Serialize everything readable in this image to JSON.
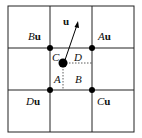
{
  "diagram": {
    "title": "",
    "grid": {
      "cols": 3,
      "rows": 3
    },
    "vector_label": "u",
    "corner_labels": [
      {
        "id": "B",
        "text_italic": "B",
        "text_bold": "u",
        "x": 28,
        "y": 30
      },
      {
        "id": "A",
        "text_italic": "A",
        "text_bold": "u",
        "x": 98,
        "y": 30
      },
      {
        "id": "D",
        "text_italic": "D",
        "text_bold": "u",
        "x": 26,
        "y": 96
      },
      {
        "id": "C",
        "text_italic": "C",
        "text_bold": "u",
        "x": 97,
        "y": 96
      }
    ],
    "region_labels": [
      {
        "text": "C",
        "x": 52,
        "y": 51
      },
      {
        "text": "D",
        "x": 74,
        "y": 51
      },
      {
        "text": "A",
        "x": 54,
        "y": 73
      },
      {
        "text": "B",
        "x": 74,
        "y": 73
      }
    ],
    "colors": {
      "line": "#222222",
      "dot": "#000000",
      "background": "#ffffff"
    }
  }
}
